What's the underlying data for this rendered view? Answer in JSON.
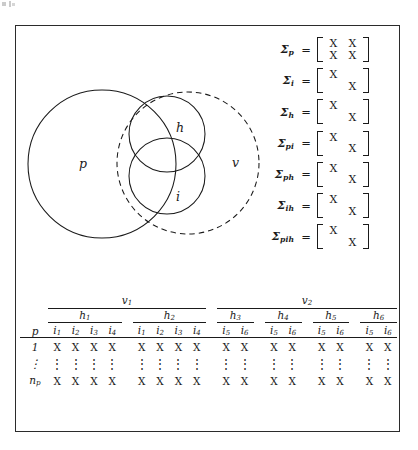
{
  "figure": {
    "venn": {
      "circles": [
        {
          "id": "p",
          "label": "p",
          "style": "solid",
          "cx": 86,
          "cy": 138,
          "r": 74
        },
        {
          "id": "v",
          "label": "v",
          "style": "dashed",
          "cx": 172,
          "cy": 137,
          "r": 71
        },
        {
          "id": "h",
          "label": "h",
          "style": "solid",
          "cx": 151,
          "cy": 108,
          "r": 38
        },
        {
          "id": "i",
          "label": "i",
          "style": "solid",
          "cx": 151,
          "cy": 150,
          "r": 38
        }
      ],
      "labels": {
        "p": "p",
        "v": "v",
        "h": "h",
        "i": "i"
      }
    },
    "matrices": [
      {
        "name": "Σ",
        "subscript": "p",
        "equals": "=",
        "cells": [
          [
            "X",
            "X"
          ],
          [
            "X",
            "X"
          ]
        ]
      },
      {
        "name": "Σ",
        "subscript": "i",
        "equals": "=",
        "cells": [
          [
            "X",
            ""
          ],
          [
            "",
            "X"
          ]
        ]
      },
      {
        "name": "Σ",
        "subscript": "h",
        "equals": "=",
        "cells": [
          [
            "X",
            ""
          ],
          [
            "",
            "X"
          ]
        ]
      },
      {
        "name": "Σ",
        "subscript": "pi",
        "equals": "=",
        "cells": [
          [
            "X",
            ""
          ],
          [
            "",
            "X"
          ]
        ]
      },
      {
        "name": "Σ",
        "subscript": "ph",
        "equals": "=",
        "cells": [
          [
            "X",
            ""
          ],
          [
            "",
            "X"
          ]
        ]
      },
      {
        "name": "Σ",
        "subscript": "ih",
        "equals": "=",
        "cells": [
          [
            "X",
            ""
          ],
          [
            "",
            "X"
          ]
        ]
      },
      {
        "name": "Σ",
        "subscript": "pih",
        "equals": "=",
        "cells": [
          [
            "X",
            ""
          ],
          [
            "",
            "X"
          ]
        ]
      }
    ],
    "table": {
      "row_header_label": "p",
      "v_groups": [
        {
          "label": "v",
          "sub": "1",
          "span": 8
        },
        {
          "label": "v",
          "sub": "2",
          "span": 8
        }
      ],
      "h_groups": [
        {
          "label": "h",
          "sub": "1",
          "span": 4
        },
        {
          "label": "h",
          "sub": "2",
          "span": 4
        },
        {
          "label": "h",
          "sub": "3",
          "span": 2
        },
        {
          "label": "h",
          "sub": "4",
          "span": 2
        },
        {
          "label": "h",
          "sub": "5",
          "span": 2
        },
        {
          "label": "h",
          "sub": "6",
          "span": 2
        }
      ],
      "i_headers": [
        {
          "label": "i",
          "sub": "1"
        },
        {
          "label": "i",
          "sub": "2"
        },
        {
          "label": "i",
          "sub": "3"
        },
        {
          "label": "i",
          "sub": "4"
        },
        {
          "label": "i",
          "sub": "1"
        },
        {
          "label": "i",
          "sub": "2"
        },
        {
          "label": "i",
          "sub": "3"
        },
        {
          "label": "i",
          "sub": "4"
        },
        {
          "label": "i",
          "sub": "5"
        },
        {
          "label": "i",
          "sub": "6"
        },
        {
          "label": "i",
          "sub": "5"
        },
        {
          "label": "i",
          "sub": "6"
        },
        {
          "label": "i",
          "sub": "5"
        },
        {
          "label": "i",
          "sub": "6"
        },
        {
          "label": "i",
          "sub": "5"
        },
        {
          "label": "i",
          "sub": "6"
        }
      ],
      "rows": [
        {
          "header": "1",
          "header_sub": "",
          "type": "data",
          "cells": [
            "X",
            "X",
            "X",
            "X",
            "X",
            "X",
            "X",
            "X",
            "X",
            "X",
            "X",
            "X",
            "X",
            "X",
            "X",
            "X"
          ]
        },
        {
          "header": "⋮",
          "header_sub": "",
          "type": "dots",
          "cells": [
            "⋮",
            "⋮",
            "⋮",
            "⋮",
            "⋮",
            "⋮",
            "⋮",
            "⋮",
            "⋮",
            "⋮",
            "⋮",
            "⋮",
            "⋮",
            "⋮",
            "⋮",
            "⋮"
          ]
        },
        {
          "header": "n",
          "header_sub": "p",
          "type": "data",
          "cells": [
            "X",
            "X",
            "X",
            "X",
            "X",
            "X",
            "X",
            "X",
            "X",
            "X",
            "X",
            "X",
            "X",
            "X",
            "X",
            "X"
          ]
        }
      ]
    }
  },
  "colors": {
    "ink": "#1a1a1a",
    "frame": "#2b2b2b",
    "page": "#ffffff"
  }
}
